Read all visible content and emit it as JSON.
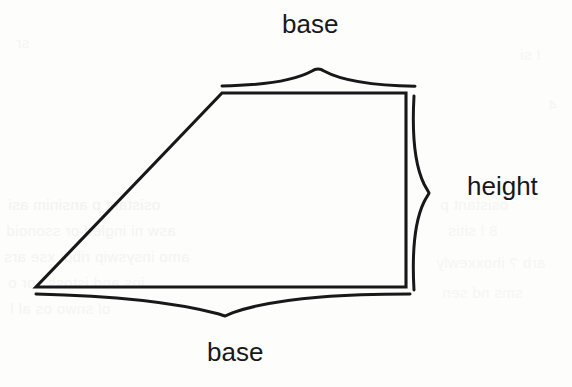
{
  "figure": {
    "name": "trapezoid-area-diagram",
    "shape": "trapezoid",
    "background_color": "#fdfdfc",
    "stroke_color": "#18181a",
    "labels": {
      "base_top": "base",
      "height": "height",
      "base_bottom": "base"
    },
    "annotations": [
      {
        "name": "top-base-brace",
        "label": "base",
        "orientation": "horizontal-up"
      },
      {
        "name": "right-height-brace",
        "label": "height",
        "orientation": "vertical-right"
      },
      {
        "name": "bottom-base-brace",
        "label": "base",
        "orientation": "horizontal-down"
      }
    ],
    "geometry": {
      "vertices": [
        {
          "name": "top-left",
          "x": 222,
          "y": 93
        },
        {
          "name": "top-right",
          "x": 406,
          "y": 93
        },
        {
          "name": "bottom-right",
          "x": 406,
          "y": 287
        },
        {
          "name": "bottom-left",
          "x": 36,
          "y": 287
        }
      ],
      "top_base_length_px": 184,
      "bottom_base_length_px": 370,
      "height_px": 194
    },
    "braces": {
      "top": {
        "x_start": 222,
        "x_end": 415,
        "baseline_y": 86,
        "tip_x": 318,
        "tip_y": 69
      },
      "bottom": {
        "x_start": 36,
        "x_end": 410,
        "baseline_y": 294,
        "tip_x": 225,
        "tip_y": 316
      },
      "right": {
        "y_start": 96,
        "y_end": 290,
        "baseline_x": 413,
        "tip_x": 429,
        "tip_y": 193
      }
    }
  },
  "scan_artifacts": {
    "description": "faint mirrored show-through text from reverse side of scanned page",
    "lines": [
      {
        "text": "osistant  p  ansinim asi",
        "x": 8,
        "y": 196,
        "opacity": 0.5
      },
      {
        "text": "asw  ni  ingled  or  ssonoid",
        "x": 6,
        "y": 222,
        "opacity": 0.45
      },
      {
        "text": "amo insyswip ribdi xse ars",
        "x": 4,
        "y": 248,
        "opacity": 0.45
      },
      {
        "text": "ins  and  istoss  sor  o",
        "x": 8,
        "y": 274,
        "opacity": 0.4
      },
      {
        "text": "ol  snwo  os  al  l",
        "x": 10,
        "y": 300,
        "opacity": 0.4
      },
      {
        "text": "osistant  p",
        "x": 440,
        "y": 196,
        "opacity": 0.4
      },
      {
        "text": "8  l  sitis",
        "x": 448,
        "y": 222,
        "opacity": 0.35
      },
      {
        "text": "arb ?  ihoxxewly",
        "x": 436,
        "y": 254,
        "opacity": 0.35
      },
      {
        "text": "sms  nd  sen",
        "x": 442,
        "y": 284,
        "opacity": 0.35
      },
      {
        "text": "I  si",
        "x": 520,
        "y": 46,
        "opacity": 0.35
      },
      {
        "text": "4",
        "x": 548,
        "y": 96,
        "opacity": 0.35
      },
      {
        "text": "sr",
        "x": 16,
        "y": 34,
        "opacity": 0.35
      }
    ]
  }
}
